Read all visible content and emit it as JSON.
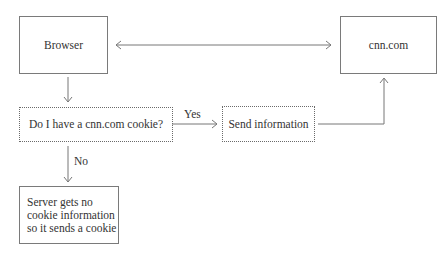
{
  "diagram": {
    "type": "flowchart",
    "nodes": {
      "browser": {
        "label": "Browser",
        "style": "solid"
      },
      "cnn": {
        "label": "cnn.com",
        "style": "solid"
      },
      "decision": {
        "label": "Do I have a cnn.com cookie?",
        "style": "dotted"
      },
      "send": {
        "label": "Send information",
        "style": "dotted"
      },
      "server": {
        "line1": "Server gets no",
        "line2": "cookie information",
        "line3": "so it sends a cookie",
        "style": "solid"
      }
    },
    "edges": {
      "yes_label": "Yes",
      "no_label": "No"
    },
    "colors": {
      "line": "#777777",
      "text": "#333333"
    }
  }
}
